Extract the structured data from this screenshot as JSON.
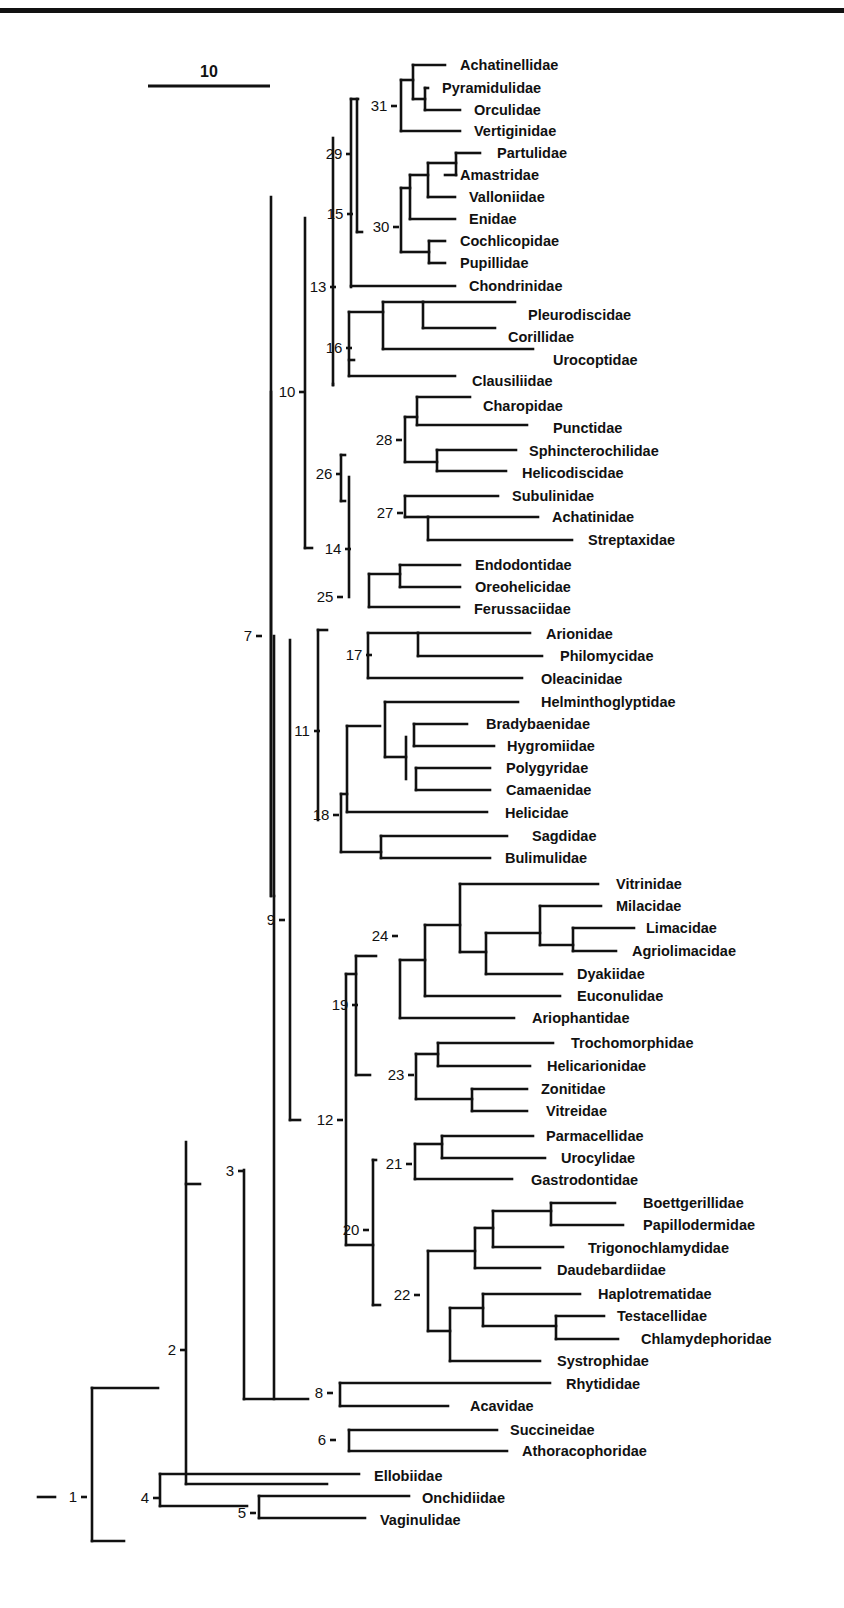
{
  "figure": {
    "type": "phylogenetic-cladogram",
    "line_color": "#111111",
    "background": "#ffffff",
    "scale_bar": {
      "label": "10",
      "x1": 148,
      "x2": 270,
      "y": 86,
      "label_x": 209,
      "label_y": 77
    }
  },
  "taxa": [
    {
      "name": "Achatinellidae",
      "y": 65,
      "x_end": 445,
      "label_x": 460
    },
    {
      "name": "Pyramidulidae",
      "y": 88,
      "x_end": 428,
      "label_x": 442
    },
    {
      "name": "Orculidae",
      "y": 110,
      "x_end": 460,
      "label_x": 474
    },
    {
      "name": "Vertiginidae",
      "y": 131,
      "x_end": 460,
      "label_x": 474
    },
    {
      "name": "Partulidae",
      "y": 153,
      "x_end": 480,
      "label_x": 497
    },
    {
      "name": "Amastridae",
      "y": 175,
      "x_end": 445,
      "label_x": 460
    },
    {
      "name": "Valloniidae",
      "y": 197,
      "x_end": 455,
      "label_x": 469
    },
    {
      "name": "Enidae",
      "y": 219,
      "x_end": 455,
      "label_x": 469
    },
    {
      "name": "Cochlicopidae",
      "y": 241,
      "x_end": 445,
      "label_x": 460
    },
    {
      "name": "Pupillidae",
      "y": 263,
      "x_end": 445,
      "label_x": 460
    },
    {
      "name": "Chondrinidae",
      "y": 286,
      "x_end": 455,
      "label_x": 469
    },
    {
      "name": "Pleurodiscidae",
      "y": 315,
      "x_end": 515,
      "label_x": 528
    },
    {
      "name": "Corillidae",
      "y": 337,
      "x_end": 495,
      "label_x": 508
    },
    {
      "name": "Urocoptidae",
      "y": 360,
      "x_end": 533,
      "label_x": 553
    },
    {
      "name": "Clausiliidae",
      "y": 381,
      "x_end": 455,
      "label_x": 472
    },
    {
      "name": "Charopidae",
      "y": 406,
      "x_end": 470,
      "label_x": 483
    },
    {
      "name": "Punctidae",
      "y": 428,
      "x_end": 527,
      "label_x": 553
    },
    {
      "name": "Sphincterochilidae",
      "y": 451,
      "x_end": 516,
      "label_x": 529
    },
    {
      "name": "Helicodiscidae",
      "y": 473,
      "x_end": 506,
      "label_x": 522
    },
    {
      "name": "Subulinidae",
      "y": 496,
      "x_end": 498,
      "label_x": 512
    },
    {
      "name": "Achatinidae",
      "y": 517,
      "x_end": 538,
      "label_x": 552
    },
    {
      "name": "Streptaxidae",
      "y": 540,
      "x_end": 572,
      "label_x": 588
    },
    {
      "name": "Endodontidae",
      "y": 565,
      "x_end": 460,
      "label_x": 475
    },
    {
      "name": "Oreohelicidae",
      "y": 587,
      "x_end": 460,
      "label_x": 475
    },
    {
      "name": "Ferussaciidae",
      "y": 609,
      "x_end": 459,
      "label_x": 474
    },
    {
      "name": "Arionidae",
      "y": 634,
      "x_end": 530,
      "label_x": 546
    },
    {
      "name": "Philomycidae",
      "y": 656,
      "x_end": 542,
      "label_x": 560
    },
    {
      "name": "Oleacinidae",
      "y": 679,
      "x_end": 522,
      "label_x": 541
    },
    {
      "name": "Helminthoglyptidae",
      "y": 702,
      "x_end": 518,
      "label_x": 541
    },
    {
      "name": "Bradybaenidae",
      "y": 724,
      "x_end": 467,
      "label_x": 486
    },
    {
      "name": "Hygromiidae",
      "y": 746,
      "x_end": 494,
      "label_x": 507
    },
    {
      "name": "Polygyridae",
      "y": 768,
      "x_end": 490,
      "label_x": 506
    },
    {
      "name": "Camaenidae",
      "y": 790,
      "x_end": 490,
      "label_x": 506
    },
    {
      "name": "Helicidae",
      "y": 813,
      "x_end": 487,
      "label_x": 505
    },
    {
      "name": "Sagdidae",
      "y": 836,
      "x_end": 507,
      "label_x": 532
    },
    {
      "name": "Bulimulidae",
      "y": 858,
      "x_end": 490,
      "label_x": 505
    },
    {
      "name": "Vitrinidae",
      "y": 884,
      "x_end": 598,
      "label_x": 616
    },
    {
      "name": "Milacidae",
      "y": 906,
      "x_end": 601,
      "label_x": 616
    },
    {
      "name": "Limacidae",
      "y": 928,
      "x_end": 634,
      "label_x": 646
    },
    {
      "name": "Agriolimacidae",
      "y": 951,
      "x_end": 616,
      "label_x": 632
    },
    {
      "name": "Dyakiidae",
      "y": 974,
      "x_end": 562,
      "label_x": 577
    },
    {
      "name": "Euconulidae",
      "y": 996,
      "x_end": 560,
      "label_x": 577
    },
    {
      "name": "Ariophantidae",
      "y": 1018,
      "x_end": 514,
      "label_x": 532
    },
    {
      "name": "Trochomorphidae",
      "y": 1043,
      "x_end": 553,
      "label_x": 571
    },
    {
      "name": "Helicarionidae",
      "y": 1066,
      "x_end": 530,
      "label_x": 547
    },
    {
      "name": "Zonitidae",
      "y": 1089,
      "x_end": 527,
      "label_x": 541
    },
    {
      "name": "Vitreidae",
      "y": 1111,
      "x_end": 527,
      "label_x": 546
    },
    {
      "name": "Parmacellidae",
      "y": 1136,
      "x_end": 533,
      "label_x": 546
    },
    {
      "name": "Urocylidae",
      "y": 1158,
      "x_end": 545,
      "label_x": 561
    },
    {
      "name": "Gastrodontidae",
      "y": 1180,
      "x_end": 512,
      "label_x": 531
    },
    {
      "name": "Boettgerillidae",
      "y": 1203,
      "x_end": 615,
      "label_x": 643
    },
    {
      "name": "Papillodermidae",
      "y": 1225,
      "x_end": 623,
      "label_x": 643
    },
    {
      "name": "Trigonochlamydidae",
      "y": 1248,
      "x_end": 563,
      "label_x": 588
    },
    {
      "name": "Daudebardiidae",
      "y": 1270,
      "x_end": 540,
      "label_x": 557
    },
    {
      "name": "Haplotrematidae",
      "y": 1294,
      "x_end": 580,
      "label_x": 598
    },
    {
      "name": "Testacellidae",
      "y": 1316,
      "x_end": 604,
      "label_x": 617
    },
    {
      "name": "Chlamydephoridae",
      "y": 1339,
      "x_end": 618,
      "label_x": 641
    },
    {
      "name": "Systrophidae",
      "y": 1361,
      "x_end": 540,
      "label_x": 557
    },
    {
      "name": "Rhytididae",
      "y": 1384,
      "x_end": 550,
      "label_x": 566
    },
    {
      "name": "Acavidae",
      "y": 1406,
      "x_end": 448,
      "label_x": 470
    },
    {
      "name": "Succineidae",
      "y": 1430,
      "x_end": 497,
      "label_x": 510
    },
    {
      "name": "Athoracophoridae",
      "y": 1451,
      "x_end": 507,
      "label_x": 522
    },
    {
      "name": "Ellobiidae",
      "y": 1476,
      "x_end": 359,
      "label_x": 374
    },
    {
      "name": "Onchidiidae",
      "y": 1498,
      "x_end": 409,
      "label_x": 422
    },
    {
      "name": "Vaginulidae",
      "y": 1520,
      "x_end": 365,
      "label_x": 380
    }
  ],
  "nodes": [
    {
      "label": "1",
      "x": 40,
      "y": 1497,
      "label_x": 73
    },
    {
      "label": "2",
      "x": 188,
      "y": 1350,
      "label_x": 172
    },
    {
      "label": "3",
      "x": 244,
      "y": 1171,
      "label_x": 230
    },
    {
      "label": "4",
      "x": 136,
      "y": 1498,
      "label_x": 145
    },
    {
      "label": "5",
      "x": 247,
      "y": 1513,
      "label_x": 242
    },
    {
      "label": "6",
      "x": 337,
      "y": 1440,
      "label_x": 322
    },
    {
      "label": "7",
      "x": 271,
      "y": 636,
      "label_x": 248
    },
    {
      "label": "8",
      "x": 336,
      "y": 1393,
      "label_x": 319
    },
    {
      "label": "9",
      "x": 290,
      "y": 920,
      "label_x": 271
    },
    {
      "label": "10",
      "x": 304,
      "y": 392,
      "label_x": 287
    },
    {
      "label": "11",
      "x": 317,
      "y": 731,
      "label_x": 302
    },
    {
      "label": "12",
      "x": 345,
      "y": 1120,
      "label_x": 325
    },
    {
      "label": "13",
      "x": 333,
      "y": 287,
      "label_x": 318
    },
    {
      "label": "14",
      "x": 349,
      "y": 549,
      "label_x": 333
    },
    {
      "label": "15",
      "x": 351,
      "y": 214,
      "label_x": 335
    },
    {
      "label": "16",
      "x": 347,
      "y": 348,
      "label_x": 334
    },
    {
      "label": "17",
      "x": 367,
      "y": 655,
      "label_x": 354
    },
    {
      "label": "18",
      "x": 340,
      "y": 815,
      "label_x": 321
    },
    {
      "label": "19",
      "x": 356,
      "y": 1005,
      "label_x": 340
    },
    {
      "label": "20",
      "x": 373,
      "y": 1230,
      "label_x": 351
    },
    {
      "label": "21",
      "x": 415,
      "y": 1164,
      "label_x": 394
    },
    {
      "label": "22",
      "x": 422,
      "y": 1295,
      "label_x": 402
    },
    {
      "label": "23",
      "x": 416,
      "y": 1075,
      "label_x": 396
    },
    {
      "label": "24",
      "x": 400,
      "y": 936,
      "label_x": 380
    },
    {
      "label": "25",
      "x": 340,
      "y": 597,
      "label_x": 325
    },
    {
      "label": "26",
      "x": 339,
      "y": 474,
      "label_x": 324
    },
    {
      "label": "27",
      "x": 402,
      "y": 513,
      "label_x": 385
    },
    {
      "label": "28",
      "x": 402,
      "y": 440,
      "label_x": 384
    },
    {
      "label": "29",
      "x": 352,
      "y": 154,
      "label_x": 334
    },
    {
      "label": "30",
      "x": 400,
      "y": 227,
      "label_x": 381
    },
    {
      "label": "31",
      "x": 397,
      "y": 106,
      "label_x": 379
    }
  ],
  "segments": [
    [
      38,
      1497,
      55,
      1497
    ],
    [
      92,
      1388,
      92,
      1541
    ],
    [
      92,
      1388,
      158,
      1388
    ],
    [
      92,
      1541,
      124,
      1541
    ],
    [
      186,
      1142,
      186,
      1484
    ],
    [
      186,
      1184,
      200,
      1184
    ],
    [
      186,
      1484,
      327,
      1484
    ],
    [
      244,
      1170,
      244,
      1399
    ],
    [
      244,
      1399,
      308,
      1399
    ],
    [
      274,
      896,
      274,
      1399
    ],
    [
      274,
      636,
      274,
      896
    ],
    [
      160,
      1474,
      160,
      1506
    ],
    [
      160,
      1474,
      359,
      1474
    ],
    [
      160,
      1506,
      247,
      1506
    ],
    [
      259,
      1496,
      259,
      1518
    ],
    [
      259,
      1496,
      409,
      1496
    ],
    [
      259,
      1518,
      365,
      1518
    ],
    [
      349,
      1430,
      349,
      1451
    ],
    [
      349,
      1430,
      497,
      1430
    ],
    [
      349,
      1451,
      507,
      1451
    ],
    [
      340,
      1383,
      340,
      1406
    ],
    [
      340,
      1383,
      550,
      1383
    ],
    [
      340,
      1406,
      448,
      1406
    ],
    [
      271,
      197,
      271,
      896
    ],
    [
      271,
      392,
      271,
      896
    ],
    [
      290,
      640,
      290,
      1120
    ],
    [
      290,
      1120,
      300,
      1120
    ],
    [
      305,
      218,
      305,
      548
    ],
    [
      305,
      548,
      312,
      548
    ],
    [
      333,
      138,
      333,
      385
    ],
    [
      351,
      99,
      351,
      287
    ],
    [
      351,
      286,
      455,
      286
    ],
    [
      351,
      99,
      358,
      99
    ],
    [
      357,
      99,
      357,
      232
    ],
    [
      357,
      232,
      362,
      232
    ],
    [
      318,
      630,
      318,
      820
    ],
    [
      318,
      630,
      327,
      630
    ],
    [
      333,
      384,
      333,
      385
    ],
    [
      349,
      312,
      349,
      376
    ],
    [
      349,
      360,
      354,
      360
    ],
    [
      349,
      312,
      383,
      312
    ],
    [
      349,
      376,
      455,
      376
    ],
    [
      383,
      302,
      383,
      349
    ],
    [
      383,
      349,
      533,
      349
    ],
    [
      383,
      302,
      423,
      302
    ],
    [
      423,
      302,
      423,
      328
    ],
    [
      423,
      302,
      515,
      302
    ],
    [
      423,
      328,
      495,
      328
    ],
    [
      349,
      477,
      349,
      597
    ],
    [
      341,
      455,
      341,
      501
    ],
    [
      341,
      455,
      345,
      455
    ],
    [
      341,
      501,
      345,
      501
    ],
    [
      405,
      417,
      405,
      462
    ],
    [
      405,
      417,
      417,
      417
    ],
    [
      405,
      462,
      437,
      462
    ],
    [
      417,
      397,
      417,
      425
    ],
    [
      417,
      397,
      470,
      397
    ],
    [
      417,
      425,
      527,
      425
    ],
    [
      437,
      450,
      437,
      471
    ],
    [
      437,
      450,
      516,
      450
    ],
    [
      437,
      471,
      506,
      471
    ],
    [
      405,
      496,
      405,
      517
    ],
    [
      405,
      496,
      498,
      496
    ],
    [
      405,
      517,
      428,
      517
    ],
    [
      428,
      517,
      428,
      540
    ],
    [
      428,
      517,
      538,
      517
    ],
    [
      428,
      540,
      572,
      540
    ],
    [
      369,
      574,
      369,
      607
    ],
    [
      369,
      574,
      400,
      574
    ],
    [
      369,
      607,
      459,
      607
    ],
    [
      400,
      565,
      400,
      587
    ],
    [
      400,
      565,
      460,
      565
    ],
    [
      400,
      587,
      460,
      587
    ],
    [
      368,
      633,
      368,
      678
    ],
    [
      368,
      633,
      418,
      633
    ],
    [
      368,
      678,
      522,
      678
    ],
    [
      418,
      633,
      418,
      656
    ],
    [
      418,
      633,
      530,
      633
    ],
    [
      418,
      656,
      542,
      656
    ],
    [
      341,
      794,
      341,
      852
    ],
    [
      341,
      794,
      347,
      794
    ],
    [
      341,
      852,
      381,
      852
    ],
    [
      347,
      726,
      347,
      812
    ],
    [
      347,
      726,
      380,
      726
    ],
    [
      347,
      812,
      487,
      812
    ],
    [
      385,
      702,
      385,
      757
    ],
    [
      385,
      702,
      518,
      702
    ],
    [
      385,
      757,
      406,
      757
    ],
    [
      406,
      737,
      406,
      779
    ],
    [
      414,
      724,
      414,
      746
    ],
    [
      414,
      724,
      467,
      724
    ],
    [
      414,
      746,
      494,
      746
    ],
    [
      416,
      768,
      416,
      790
    ],
    [
      416,
      768,
      490,
      768
    ],
    [
      416,
      790,
      490,
      790
    ],
    [
      381,
      836,
      381,
      858
    ],
    [
      381,
      836,
      507,
      836
    ],
    [
      381,
      858,
      490,
      858
    ],
    [
      346,
      974,
      346,
      1245
    ],
    [
      346,
      974,
      356,
      974
    ],
    [
      346,
      1245,
      373,
      1245
    ],
    [
      356,
      956,
      356,
      1075
    ],
    [
      356,
      956,
      376,
      956
    ],
    [
      356,
      1075,
      370,
      1075
    ],
    [
      400,
      960,
      400,
      1018
    ],
    [
      400,
      960,
      425,
      960
    ],
    [
      400,
      1018,
      514,
      1018
    ],
    [
      425,
      925,
      425,
      996
    ],
    [
      425,
      925,
      460,
      925
    ],
    [
      425,
      996,
      560,
      996
    ],
    [
      460,
      884,
      460,
      952
    ],
    [
      460,
      884,
      598,
      884
    ],
    [
      460,
      952,
      486,
      952
    ],
    [
      486,
      933,
      486,
      974
    ],
    [
      486,
      933,
      540,
      933
    ],
    [
      486,
      974,
      562,
      974
    ],
    [
      540,
      906,
      540,
      945
    ],
    [
      540,
      906,
      601,
      906
    ],
    [
      540,
      945,
      573,
      945
    ],
    [
      573,
      928,
      573,
      951
    ],
    [
      573,
      928,
      634,
      928
    ],
    [
      573,
      951,
      616,
      951
    ],
    [
      416,
      1054,
      416,
      1099
    ],
    [
      416,
      1054,
      438,
      1054
    ],
    [
      416,
      1099,
      472,
      1099
    ],
    [
      438,
      1043,
      438,
      1066
    ],
    [
      438,
      1043,
      553,
      1043
    ],
    [
      438,
      1066,
      530,
      1066
    ],
    [
      472,
      1089,
      472,
      1111
    ],
    [
      472,
      1089,
      527,
      1089
    ],
    [
      472,
      1111,
      527,
      1111
    ],
    [
      373,
      1160,
      373,
      1305
    ],
    [
      373,
      1160,
      376,
      1160
    ],
    [
      373,
      1305,
      380,
      1305
    ],
    [
      415,
      1144,
      415,
      1179
    ],
    [
      415,
      1144,
      442,
      1144
    ],
    [
      415,
      1179,
      512,
      1179
    ],
    [
      442,
      1136,
      442,
      1158
    ],
    [
      442,
      1136,
      533,
      1136
    ],
    [
      442,
      1158,
      545,
      1158
    ],
    [
      428,
      1251,
      428,
      1331
    ],
    [
      428,
      1251,
      475,
      1251
    ],
    [
      428,
      1331,
      450,
      1331
    ],
    [
      475,
      1228,
      475,
      1268
    ],
    [
      475,
      1228,
      493,
      1228
    ],
    [
      475,
      1268,
      540,
      1268
    ],
    [
      493,
      1211,
      493,
      1247
    ],
    [
      493,
      1211,
      551,
      1211
    ],
    [
      493,
      1247,
      563,
      1247
    ],
    [
      551,
      1203,
      551,
      1225
    ],
    [
      551,
      1203,
      615,
      1203
    ],
    [
      551,
      1225,
      623,
      1225
    ],
    [
      450,
      1308,
      450,
      1361
    ],
    [
      450,
      1308,
      483,
      1308
    ],
    [
      450,
      1361,
      540,
      1361
    ],
    [
      483,
      1294,
      483,
      1326
    ],
    [
      483,
      1294,
      580,
      1294
    ],
    [
      483,
      1326,
      556,
      1326
    ],
    [
      556,
      1316,
      556,
      1339
    ],
    [
      556,
      1316,
      604,
      1316
    ],
    [
      556,
      1339,
      618,
      1339
    ],
    [
      401,
      80,
      401,
      131
    ],
    [
      401,
      80,
      413,
      80
    ],
    [
      401,
      131,
      460,
      131
    ],
    [
      413,
      65,
      413,
      99
    ],
    [
      413,
      65,
      445,
      65
    ],
    [
      413,
      99,
      425,
      99
    ],
    [
      425,
      88,
      425,
      110
    ],
    [
      425,
      88,
      428,
      88
    ],
    [
      425,
      110,
      460,
      110
    ],
    [
      401,
      188,
      401,
      252
    ],
    [
      401,
      188,
      410,
      188
    ],
    [
      401,
      252,
      429,
      252
    ],
    [
      410,
      175,
      410,
      219
    ],
    [
      410,
      175,
      428,
      175
    ],
    [
      410,
      219,
      455,
      219
    ],
    [
      428,
      163,
      428,
      197
    ],
    [
      428,
      163,
      456,
      163
    ],
    [
      428,
      197,
      455,
      197
    ],
    [
      456,
      153,
      456,
      175
    ],
    [
      456,
      153,
      480,
      153
    ],
    [
      456,
      175,
      445,
      175
    ],
    [
      429,
      241,
      429,
      263
    ],
    [
      429,
      241,
      445,
      241
    ],
    [
      429,
      263,
      445,
      263
    ]
  ]
}
